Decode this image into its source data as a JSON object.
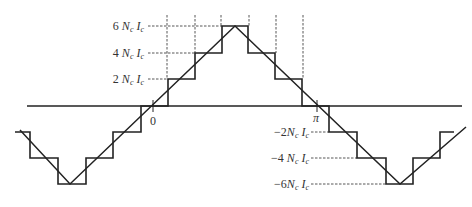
{
  "diagram": {
    "colors": {
      "line": "#222222",
      "dashed": "#444444",
      "text": "#333333",
      "background": "#ffffff"
    },
    "axis": {
      "origin_label": "0",
      "pi_label": "π"
    },
    "level_labels": {
      "pos6": {
        "coef": "6",
        "n": "N",
        "nsub": "c",
        "i": "I",
        "isub": "c"
      },
      "pos4": {
        "coef": "4",
        "n": "N",
        "nsub": "c",
        "i": "I",
        "isub": "c"
      },
      "pos2": {
        "coef": "2",
        "n": "N",
        "nsub": "c",
        "i": "I",
        "isub": "c"
      },
      "neg2": {
        "coef": "−2",
        "n": "N",
        "nsub": "c",
        "i": "I",
        "isub": "c"
      },
      "neg4": {
        "coef": "−4",
        "n": "N",
        "nsub": "c",
        "i": "I",
        "isub": "c"
      },
      "neg6": {
        "coef": "−6",
        "n": "N",
        "nsub": "c",
        "i": "I",
        "isub": "c"
      }
    },
    "levels": [
      6,
      4,
      2,
      0,
      -2,
      -4,
      -6
    ],
    "series": [
      {
        "name": "staircase MMF",
        "type": "step"
      },
      {
        "name": "triangular fundamental",
        "type": "line"
      }
    ]
  }
}
